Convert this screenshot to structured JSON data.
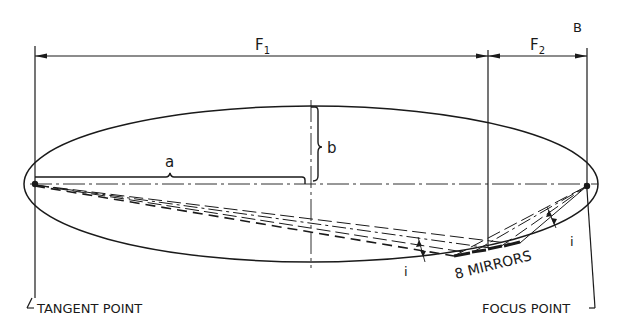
{
  "diagram": {
    "dimensions": {
      "f1_label": "F",
      "f1_sub": "1",
      "f2_label": "F",
      "f2_sub": "2",
      "b_corner_label": "B"
    },
    "axes": {
      "semi_major_label": "a",
      "semi_minor_label": "b"
    },
    "angles": {
      "left_label": "i",
      "right_label": "i"
    },
    "annotations": {
      "mirrors": "8 MIRRORS",
      "tangent_point": "TANGENT POINT",
      "focus_point": "FOCUS POINT"
    },
    "colors": {
      "ink": "#1a1a1a",
      "background": "#ffffff"
    }
  }
}
